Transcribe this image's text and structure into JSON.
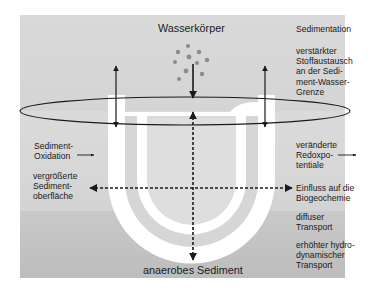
{
  "diagram": {
    "title_top": "Wasserkörper",
    "title_bottom": "anaerobes Sediment",
    "colors": {
      "background_top": "#d7d7d7",
      "background_bottom": "#c2c2c2",
      "burrow_band": "#ffffff",
      "burrow_inner": "#d9d9d9",
      "line": "#1a1a1a",
      "particles": "#8c8c8c"
    },
    "right_labels": [
      {
        "id": "sedimentation",
        "text": "Sedimentation"
      },
      {
        "id": "stoffaustausch",
        "text": "verstärkter\nStoffaustausch\nan der Sedi-\nment-Wasser-\nGrenze"
      },
      {
        "id": "redoxpotentiale",
        "text": "veränderte\nRedoxpo-\ntentiale"
      },
      {
        "id": "biogeochemie",
        "text": "Einfluss auf die\nBiogeochemie"
      },
      {
        "id": "diffuser-transport",
        "text": "diffuser\nTransport"
      },
      {
        "id": "hydrodynamischer-transport",
        "text": "erhöhter hydro-\ndynamischer\nTransport"
      }
    ],
    "left_labels": [
      {
        "id": "sediment-oxidation",
        "text": "Sediment-\nOxidation"
      },
      {
        "id": "sedimentoberflaeche",
        "text": "vergrößerte\nSediment-\noberfläche"
      }
    ],
    "arrows": [
      {
        "id": "left-vertical",
        "style": "solid",
        "direction": "both",
        "from": "Wasserkörper",
        "to": "Sediment-Wasser-Grenze"
      },
      {
        "id": "right-vertical",
        "style": "solid",
        "direction": "both"
      },
      {
        "id": "center-sedimentation",
        "style": "solid",
        "direction": "down"
      },
      {
        "id": "center-dashed-vertical",
        "style": "dashed",
        "direction": "both"
      },
      {
        "id": "center-dashed-horizontal",
        "style": "dashed",
        "direction": "both"
      },
      {
        "id": "oxidation-arrow",
        "style": "solid",
        "direction": "right"
      },
      {
        "id": "redox-arrow",
        "style": "solid",
        "direction": "right"
      }
    ],
    "particle_count": 12
  }
}
